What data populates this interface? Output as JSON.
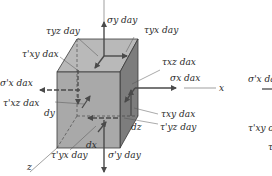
{
  "figure": {
    "colors": {
      "front_face": "#a9a9a9",
      "top_face": "#b9b9b9",
      "side_face": "#7d7d7d",
      "edge": "#3a3a3a",
      "arrow": "#4a4a4a",
      "text": "#2a2a2a"
    },
    "labels": {
      "sigma_y": "σy day",
      "tau_yx": "τyx day",
      "tau_yz": "τyz day",
      "tau_xy_prime_top": "τ'xy dax",
      "tau_xz": "τxz dax",
      "sigma_x": "σx dax",
      "sigma_x_prime": "σ'x dax",
      "tau_xz_prime": "τ'xz dax",
      "tau_xy": "τxy dax",
      "tau_yz_prime": "τ'yz day",
      "tau_yx_prime": "τ'yx day",
      "sigma_y_prime": "σ'y day",
      "dy": "dy",
      "dz": "dz",
      "dx": "dx",
      "axis_x": "x",
      "axis_z": "z",
      "right_sigma_x_prime": "σ'x da",
      "right_tau_xy_prime": "τ'xy da"
    }
  }
}
